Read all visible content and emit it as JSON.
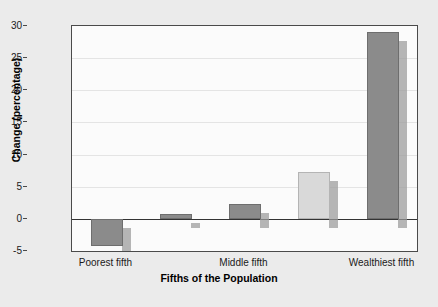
{
  "chart_data": {
    "type": "bar",
    "title": "",
    "xlabel": "Fifths of the Population",
    "ylabel": "Change (percentage)",
    "categories": [
      "Poorest fifth",
      "Second fifth",
      "Middle fifth",
      "Fourth fifth",
      "Wealthiest fifth"
    ],
    "visible_category_labels": [
      "Poorest fifth",
      "Middle fifth",
      "Wealthiest fifth"
    ],
    "values": [
      -4.2,
      0.8,
      2.3,
      7.3,
      29.0
    ],
    "bar_styles": [
      "dark",
      "dark",
      "dark",
      "light",
      "dark"
    ],
    "ylim": [
      -5,
      30
    ],
    "yticks": [
      -5,
      0,
      5,
      10,
      15,
      20,
      25,
      30
    ],
    "ytick_labels": [
      "-5",
      "0",
      "5",
      "10",
      "15",
      "20",
      "25",
      "30"
    ],
    "grid": true,
    "legend": null,
    "colors": {
      "bar_dark": "#8b8b8b",
      "bar_light": "#d9d9d9",
      "bar_shadow": "#9a9a9a",
      "plot_background": "#fbfbfb",
      "page_background": "#ebebeb",
      "axis": "#4a4a4a",
      "zero_line": "#333333",
      "gridline": "#e4e4e4",
      "text": "#1a1a1a"
    }
  }
}
